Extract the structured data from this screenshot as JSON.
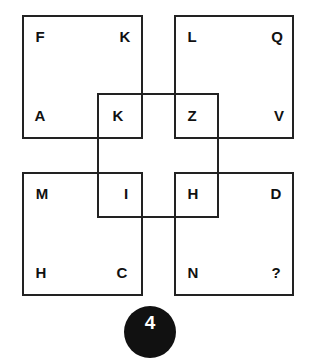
{
  "puzzle": {
    "boxes": {
      "top_left": {
        "tl": "F",
        "tr": "K",
        "bl": "A",
        "br": "K"
      },
      "top_right": {
        "tl": "L",
        "tr": "Q",
        "bl": "Z",
        "br": "V"
      },
      "bottom_left": {
        "tl": "M",
        "tr": "I",
        "bl": "H",
        "br": "C"
      },
      "bottom_right": {
        "tl": "H",
        "tr": "D",
        "bl": "N",
        "br": "?"
      }
    },
    "number": "4"
  }
}
